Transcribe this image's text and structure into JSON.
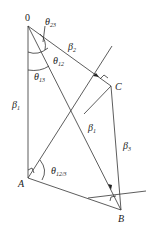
{
  "diagram": {
    "points": {
      "O": {
        "label": "0",
        "x": 28,
        "y": 26
      },
      "A": {
        "label": "A",
        "x": 28,
        "y": 178
      },
      "B": {
        "label": "B",
        "x": 121,
        "y": 210
      },
      "C": {
        "label": "C",
        "x": 111,
        "y": 86
      }
    },
    "labels": {
      "beta1_left": {
        "main": "β",
        "sub": "1"
      },
      "beta1_diag": {
        "main": "β",
        "sub": "1"
      },
      "beta2": {
        "main": "β",
        "sub": "2"
      },
      "beta3": {
        "main": "β",
        "sub": "3"
      },
      "theta23": {
        "main": "θ",
        "sub": "23"
      },
      "theta12": {
        "main": "θ",
        "sub": "12"
      },
      "theta13": {
        "main": "θ",
        "sub": "13"
      },
      "theta12_3": {
        "main": "θ",
        "sub": "12/3"
      }
    }
  }
}
